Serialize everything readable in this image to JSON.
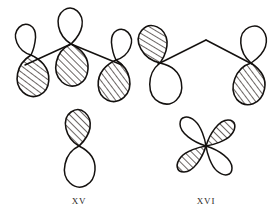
{
  "figure": {
    "background_color": "#ffffff",
    "stroke_color": "#14110f",
    "hatch_color": "#3a3330",
    "structures": [
      {
        "id": "XV",
        "label": "XV",
        "label_position": {
          "x": 79,
          "y": 202
        },
        "description": "Three-center p-orbital array with a peaked two-bond framework, above an isolated vertical p-orbital",
        "parts": [
          {
            "name": "left-p-orbital",
            "type": "p-orbital",
            "center": {
              "x": 31,
              "y": 55
            },
            "tilt_deg": -8,
            "top_lobe": {
              "shaded": false,
              "size": "small"
            },
            "bottom_lobe": {
              "shaded": true,
              "size": "large"
            }
          },
          {
            "name": "center-p-orbital",
            "type": "p-orbital",
            "center": {
              "x": 71,
              "y": 44
            },
            "tilt_deg": 0,
            "top_lobe": {
              "shaded": false,
              "size": "large"
            },
            "bottom_lobe": {
              "shaded": true,
              "size": "large"
            }
          },
          {
            "name": "right-p-orbital",
            "type": "p-orbital",
            "center": {
              "x": 116,
              "y": 60
            },
            "tilt_deg": 8,
            "top_lobe": {
              "shaded": false,
              "size": "small"
            },
            "bottom_lobe": {
              "shaded": true,
              "size": "large"
            }
          },
          {
            "name": "lower-p-orbital",
            "type": "p-orbital",
            "center": {
              "x": 79,
              "y": 146
            },
            "tilt_deg": 0,
            "top_lobe": {
              "shaded": true,
              "size": "large"
            },
            "bottom_lobe": {
              "shaded": false,
              "size": "large"
            }
          }
        ],
        "bonds": [
          {
            "name": "left-bond",
            "from": {
              "x": 25,
              "y": 64
            },
            "to": {
              "x": 71,
              "y": 44
            }
          },
          {
            "name": "right-bond",
            "from": {
              "x": 71,
              "y": 44
            },
            "to": {
              "x": 121,
              "y": 64
            }
          }
        ]
      },
      {
        "id": "XVI",
        "label": "XVI",
        "label_position": {
          "x": 206,
          "y": 202
        },
        "description": "Two p-orbitals joined by a peaked two-segment bond, above a four-lobed d-orbital",
        "parts": [
          {
            "name": "left-p-orbital",
            "type": "p-orbital",
            "center": {
              "x": 160,
              "y": 60
            },
            "tilt_deg": -14,
            "top_lobe": {
              "shaded": true,
              "size": "large"
            },
            "bottom_lobe": {
              "shaded": false,
              "size": "large"
            }
          },
          {
            "name": "right-p-orbital",
            "type": "p-orbital",
            "center": {
              "x": 251,
              "y": 60
            },
            "tilt_deg": 8,
            "top_lobe": {
              "shaded": false,
              "size": "large"
            },
            "bottom_lobe": {
              "shaded": true,
              "size": "large"
            }
          },
          {
            "name": "d-orbital",
            "type": "d-orbital",
            "center": {
              "x": 206,
              "y": 146
            },
            "lobes": [
              {
                "direction": "upper-left",
                "shaded": false
              },
              {
                "direction": "upper-right",
                "shaded": true
              },
              {
                "direction": "lower-left",
                "shaded": true
              },
              {
                "direction": "lower-right",
                "shaded": false
              }
            ]
          }
        ],
        "bonds": [
          {
            "name": "left-bond",
            "from": {
              "x": 160,
              "y": 63
            },
            "to": {
              "x": 206,
              "y": 40
            }
          },
          {
            "name": "right-bond",
            "from": {
              "x": 206,
              "y": 40
            },
            "to": {
              "x": 251,
              "y": 63
            }
          }
        ]
      }
    ]
  }
}
